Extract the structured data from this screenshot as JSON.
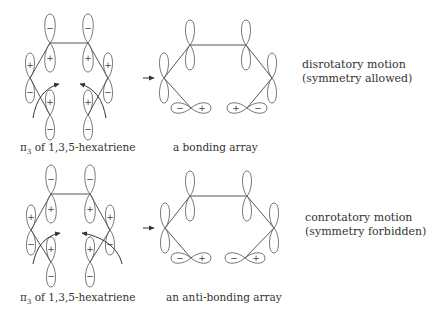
{
  "panels": [
    {
      "id": "top",
      "molecule_caption_prefix": "π",
      "molecule_caption_sub": "3",
      "molecule_caption_rest": " of 1,3,5-hexatriene",
      "array_caption": "a bonding array",
      "side_line1": "disrotatory motion",
      "side_line2": "(symmetry allowed)",
      "reaction_arrow": "→",
      "molecule_signs": {
        "top_left": {
          "upper": "−",
          "lower": "+"
        },
        "top_right": {
          "upper": "−",
          "lower": "+"
        },
        "left": {
          "upper": "+",
          "lower": "−"
        },
        "right": {
          "upper": "+",
          "lower": "−"
        },
        "bottom_left": {
          "upper": "+",
          "lower": "−"
        },
        "bottom_right": {
          "upper": "+",
          "lower": "−"
        }
      },
      "array_end_signs": {
        "bottom_left": {
          "left": "−",
          "right": "+"
        },
        "bottom_right": {
          "left": "+",
          "right": "−"
        }
      }
    },
    {
      "id": "bottom",
      "molecule_caption_prefix": "π",
      "molecule_caption_sub": "3",
      "molecule_caption_rest": " of 1,3,5-hexatriene",
      "array_caption": "an anti-bonding array",
      "side_line1": "conrotatory motion",
      "side_line2": "(symmetry forbidden)",
      "reaction_arrow": "→",
      "molecule_signs": {
        "top_left": {
          "upper": "−",
          "lower": "+"
        },
        "top_right": {
          "upper": "−",
          "lower": "+"
        },
        "left": {
          "upper": "+",
          "lower": "−"
        },
        "right": {
          "upper": "+",
          "lower": "−"
        },
        "bottom_left": {
          "upper": "+",
          "lower": "−"
        },
        "bottom_right": {
          "upper": "+",
          "lower": "−"
        }
      },
      "array_end_signs": {
        "bottom_left": {
          "left": "−",
          "right": "+"
        },
        "bottom_right": {
          "left": "−",
          "right": "+"
        }
      }
    }
  ]
}
